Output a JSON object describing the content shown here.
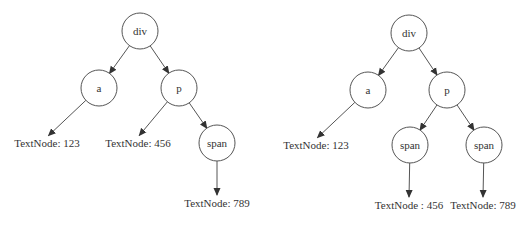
{
  "figure": {
    "caption_top": "",
    "caption_bottom": "",
    "colors": {
      "stroke": "#555555",
      "text": "#333333",
      "background": "#ffffff"
    },
    "node_radius": 18
  },
  "trees": [
    {
      "id": "before",
      "nodes": [
        {
          "id": "div",
          "label": "div",
          "type": "element",
          "cx": 140,
          "cy": 31
        },
        {
          "id": "a",
          "label": "a",
          "type": "element",
          "cx": 99,
          "cy": 88
        },
        {
          "id": "p",
          "label": "p",
          "type": "element",
          "cx": 179,
          "cy": 88
        },
        {
          "id": "span",
          "label": "span",
          "type": "element",
          "cx": 217,
          "cy": 143
        },
        {
          "id": "t123",
          "label": "TextNode: 123",
          "type": "text",
          "x": 47,
          "y": 147
        },
        {
          "id": "t456",
          "label": "TextNode: 456",
          "type": "text",
          "x": 138,
          "y": 147
        },
        {
          "id": "t789",
          "label": "TextNode: 789",
          "type": "text",
          "x": 217,
          "y": 207
        }
      ],
      "edges": [
        {
          "from": "div",
          "to": "a"
        },
        {
          "from": "div",
          "to": "p"
        },
        {
          "from": "a",
          "to": "t123"
        },
        {
          "from": "p",
          "to": "t456"
        },
        {
          "from": "p",
          "to": "span"
        },
        {
          "from": "span",
          "to": "t789"
        }
      ]
    },
    {
      "id": "after",
      "nodes": [
        {
          "id": "div",
          "label": "div",
          "type": "element",
          "cx": 409,
          "cy": 33
        },
        {
          "id": "a",
          "label": "a",
          "type": "element",
          "cx": 368,
          "cy": 90
        },
        {
          "id": "p",
          "label": "p",
          "type": "element",
          "cx": 447,
          "cy": 90
        },
        {
          "id": "span1",
          "label": "span",
          "type": "element",
          "cx": 410,
          "cy": 145
        },
        {
          "id": "span2",
          "label": "span",
          "type": "element",
          "cx": 484,
          "cy": 145
        },
        {
          "id": "t123",
          "label": "TextNode: 123",
          "type": "text",
          "x": 316,
          "y": 149
        },
        {
          "id": "t456",
          "label": "TextNode : 456",
          "type": "text",
          "x": 409,
          "y": 209
        },
        {
          "id": "t789",
          "label": "TextNode: 789",
          "type": "text",
          "x": 483,
          "y": 209
        }
      ],
      "edges": [
        {
          "from": "div",
          "to": "a"
        },
        {
          "from": "div",
          "to": "p"
        },
        {
          "from": "a",
          "to": "t123"
        },
        {
          "from": "p",
          "to": "span1"
        },
        {
          "from": "p",
          "to": "span2"
        },
        {
          "from": "span1",
          "to": "t456"
        },
        {
          "from": "span2",
          "to": "t789"
        }
      ]
    }
  ]
}
